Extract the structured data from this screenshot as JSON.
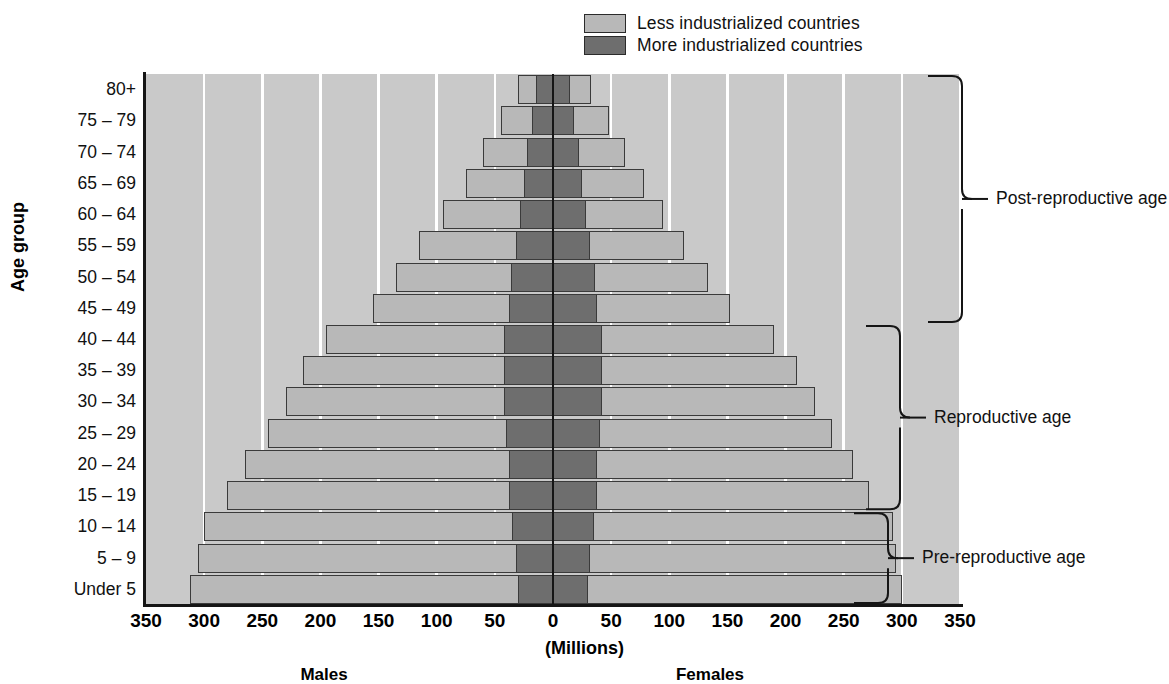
{
  "legend": {
    "items": [
      {
        "label": "Less industrialized countries",
        "color": "#b8b8b8",
        "key": "less"
      },
      {
        "label": "More industrialized countries",
        "color": "#6e6e6e",
        "key": "more"
      }
    ]
  },
  "axes": {
    "y_title": "Age group",
    "x_title": "(Millions)",
    "left_group_label": "Males",
    "right_group_label": "Females",
    "x_ticks": [
      "350",
      "300",
      "250",
      "200",
      "150",
      "100",
      "50",
      "0",
      "50",
      "100",
      "150",
      "200",
      "250",
      "300",
      "350"
    ]
  },
  "annotations": [
    {
      "label": "Post-reproductive age",
      "from_group": "45 – 49",
      "to_group": "80+"
    },
    {
      "label": "Reproductive age",
      "from_group": "15 – 19",
      "to_group": "40 – 44"
    },
    {
      "label": "Pre-reproductive age",
      "from_group": "Under 5",
      "to_group": "10 – 14"
    }
  ],
  "chart_data": {
    "type": "bar",
    "subtype": "population-pyramid",
    "title": "",
    "xlabel": "(Millions)",
    "ylabel": "Age group",
    "xlim": [
      -350,
      350
    ],
    "xtick_values": [
      -350,
      -300,
      -250,
      -200,
      -150,
      -100,
      -50,
      0,
      50,
      100,
      150,
      200,
      250,
      300,
      350
    ],
    "xtick_labels": [
      "350",
      "300",
      "250",
      "200",
      "150",
      "100",
      "50",
      "0",
      "50",
      "100",
      "150",
      "200",
      "250",
      "300",
      "350"
    ],
    "grid": true,
    "legend_position": "top-right",
    "categories": [
      "Under 5",
      "5 – 9",
      "10 – 14",
      "15 – 19",
      "20 – 24",
      "25 – 29",
      "30 – 34",
      "35 – 39",
      "40 – 44",
      "45 – 49",
      "50 – 54",
      "55 – 59",
      "60 – 64",
      "65 – 69",
      "70 – 74",
      "75 – 79",
      "80+"
    ],
    "series": [
      {
        "name": "Less industrialized countries",
        "color": "#b8b8b8",
        "males": [
          312,
          305,
          300,
          280,
          265,
          245,
          230,
          215,
          195,
          155,
          135,
          115,
          95,
          75,
          60,
          45,
          30
        ],
        "females": [
          300,
          295,
          292,
          272,
          258,
          240,
          225,
          210,
          190,
          152,
          133,
          113,
          95,
          78,
          62,
          48,
          33
        ]
      },
      {
        "name": "More industrialized countries",
        "color": "#6e6e6e",
        "males": [
          30,
          32,
          35,
          38,
          38,
          40,
          42,
          42,
          42,
          38,
          36,
          32,
          28,
          25,
          22,
          18,
          15
        ],
        "females": [
          30,
          32,
          35,
          38,
          38,
          40,
          42,
          42,
          42,
          38,
          36,
          32,
          28,
          25,
          22,
          18,
          15
        ]
      }
    ]
  }
}
